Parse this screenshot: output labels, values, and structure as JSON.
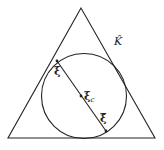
{
  "diagram": {
    "type": "geometry",
    "colors": {
      "stroke": "#222222",
      "background": "#ffffff"
    },
    "triangle": {
      "points": [
        [
          81,
          8
        ],
        [
          8,
          138
        ],
        [
          155,
          138
        ]
      ]
    },
    "circle": {
      "cx": 83,
      "cy": 96,
      "r": 43
    },
    "segment": {
      "from": [
        57,
        61
      ],
      "to": [
        106,
        131
      ]
    },
    "labels": {
      "element": "K̂",
      "point_start": "ξ",
      "center": "ξ",
      "center_sub": "c",
      "point_end": "ξ̃"
    }
  }
}
